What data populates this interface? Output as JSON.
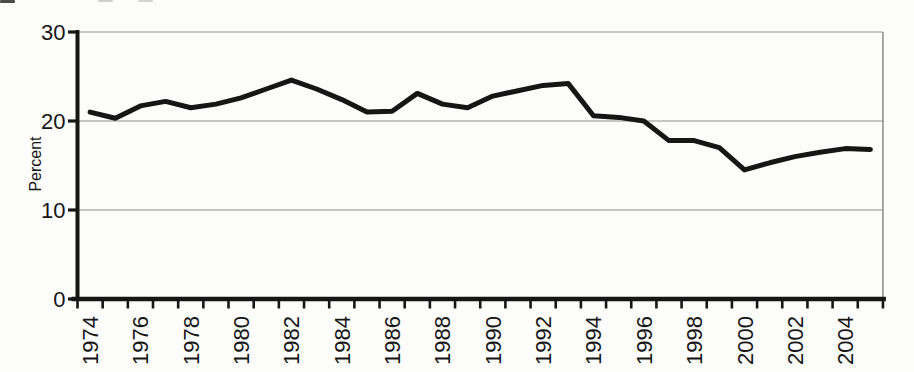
{
  "figure": {
    "background_color": "#fcfcfb",
    "ink_color": "#161616",
    "grid_color": "#8f8f8f",
    "border_color": "#6f6f6f"
  },
  "chart_data": {
    "type": "line",
    "title": "",
    "xlabel": "",
    "ylabel": "Percent",
    "x": [
      1974,
      1975,
      1976,
      1977,
      1978,
      1979,
      1980,
      1981,
      1982,
      1983,
      1984,
      1985,
      1986,
      1987,
      1988,
      1989,
      1990,
      1991,
      1992,
      1993,
      1994,
      1995,
      1996,
      1997,
      1998,
      1999,
      2000,
      2001,
      2002,
      2003,
      2004,
      2005
    ],
    "series": [
      {
        "name": "Percent",
        "color": "#161616",
        "values": [
          21.0,
          20.3,
          21.7,
          22.2,
          21.5,
          21.9,
          22.6,
          23.6,
          24.6,
          23.6,
          22.4,
          21.0,
          21.1,
          23.1,
          21.9,
          21.5,
          22.8,
          23.4,
          24.0,
          24.2,
          20.6,
          20.4,
          20.0,
          17.8,
          17.8,
          17.0,
          14.5,
          15.3,
          16.0,
          16.5,
          16.9,
          16.8
        ]
      }
    ],
    "ylim": [
      0,
      30
    ],
    "yticks": [
      0,
      10,
      20,
      30
    ],
    "xticks_labeled": [
      1974,
      1976,
      1978,
      1980,
      1982,
      1984,
      1986,
      1988,
      1990,
      1992,
      1994,
      1996,
      1998,
      2000,
      2002,
      2004
    ],
    "xtick_label_rotation": -90,
    "grid": "horizontal",
    "legend_position": "none"
  }
}
